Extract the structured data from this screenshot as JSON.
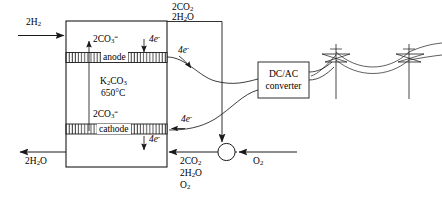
{
  "diagram": {
    "stroke_color": "#1a1a1a",
    "fill_color": "#ffffff",
    "cell": {
      "anode_label": "anode",
      "cathode_label": "cathode",
      "electrolyte_formula": "K",
      "electrolyte_formula_sub1": "2",
      "electrolyte_formula_mid": "CO",
      "electrolyte_formula_sub2": "3",
      "temperature": "650°C"
    },
    "converter": {
      "line1": "DC/AC",
      "line2": "converter"
    },
    "labels": {
      "inlet_fuel": "2H",
      "inlet_fuel_sub": "2",
      "outlet_water": "2H",
      "outlet_water_sub": "2",
      "outlet_water_tail": "O",
      "top_out_co2": "2CO",
      "top_out_co2_sub": "2",
      "top_out_h2o": "2H",
      "top_out_h2o_sub": "2",
      "top_out_h2o_tail": "O",
      "recycle_co2": "2CO",
      "recycle_co2_sub": "2",
      "recycle_h2o": "2H",
      "recycle_h2o_sub": "2",
      "recycle_h2o_tail": "O",
      "recycle_o2": "O",
      "recycle_o2_sub": "2",
      "air_o2": "O",
      "air_o2_sub": "2",
      "carbonate_anode": "2CO",
      "carbonate_anode_sub": "3",
      "carbonate_anode_sup": "=",
      "carbonate_cathode": "2CO",
      "carbonate_cathode_sub": "3",
      "carbonate_cathode_sup": "=",
      "electrons_anode_in": "4e",
      "electrons_anode_in_sup": "-",
      "electrons_anode_out": "4e",
      "electrons_anode_out_sup": "-",
      "electrons_cathode_in": "4e",
      "electrons_cathode_in_sup": "-",
      "electrons_cathode_out": "4e",
      "electrons_cathode_out_sup": "-"
    },
    "icons": {
      "mixer": "mixer-junction-circle",
      "tower_1": "transmission-tower",
      "tower_2": "transmission-tower"
    }
  }
}
